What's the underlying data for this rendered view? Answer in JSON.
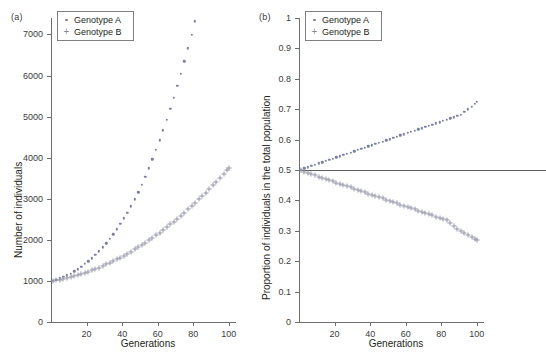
{
  "figure": {
    "panel_a_label": "(a)",
    "panel_b_label": "(b)"
  },
  "legend": {
    "series_a_label": "Genotype A",
    "series_b_label": "Genotype B",
    "marker_a": "dot",
    "marker_b": "plus"
  },
  "colors": {
    "series_a": "#7b7fa0",
    "series_b": "#9596a6",
    "axis": "#6e6e6e",
    "text": "#231f20",
    "reference_line": "#5d5d5d"
  },
  "chart_data": [
    {
      "type": "scatter",
      "panel": "(a)",
      "title": "",
      "xlabel": "Generations",
      "ylabel": "Number of individuals",
      "xlim": [
        0,
        104
      ],
      "ylim": [
        0,
        7400
      ],
      "xticks": [
        20,
        40,
        60,
        80,
        100
      ],
      "xticklabels": [
        "20",
        "40",
        "60",
        "80",
        "100"
      ],
      "yticks": [
        0,
        1000,
        2000,
        3000,
        4000,
        5000,
        6000,
        7000
      ],
      "yticklabels": [
        "0",
        "1000",
        "2000",
        "3000",
        "4000",
        "5000",
        "6000",
        "7000"
      ],
      "grid": false,
      "legend_position": "top-left",
      "x": [
        1,
        3,
        5,
        7,
        9,
        11,
        13,
        15,
        17,
        19,
        21,
        23,
        25,
        27,
        29,
        31,
        33,
        35,
        37,
        39,
        41,
        43,
        45,
        47,
        49,
        51,
        53,
        55,
        57,
        59,
        61,
        63,
        65,
        67,
        69,
        71,
        73,
        75,
        77,
        79,
        81,
        83,
        85,
        87,
        89,
        91,
        93,
        95,
        97,
        99,
        100
      ],
      "series": [
        {
          "name": "Genotype A",
          "marker": "dot",
          "values": [
            1005,
            1030,
            1060,
            1095,
            1135,
            1180,
            1230,
            1285,
            1345,
            1410,
            1480,
            1555,
            1635,
            1720,
            1815,
            1915,
            2020,
            2135,
            2255,
            2385,
            2520,
            2665,
            2820,
            2985,
            3160,
            3345,
            3540,
            3745,
            3960,
            4185,
            4420,
            4665,
            4920,
            5185,
            5460,
            5745,
            6040,
            6345,
            6660,
            6985,
            7320,
            7665,
            8020,
            8385,
            8760,
            9145,
            9540,
            9945,
            10360,
            10785,
            11000
          ]
        },
        {
          "name": "Genotype B",
          "marker": "plus",
          "values": [
            1000,
            1015,
            1032,
            1050,
            1070,
            1092,
            1115,
            1140,
            1167,
            1195,
            1225,
            1257,
            1290,
            1325,
            1362,
            1400,
            1440,
            1482,
            1525,
            1570,
            1617,
            1665,
            1715,
            1767,
            1820,
            1875,
            1932,
            1990,
            2050,
            2112,
            2175,
            2240,
            2307,
            2375,
            2445,
            2517,
            2590,
            2665,
            2742,
            2820,
            2900,
            2982,
            3065,
            3150,
            3237,
            3325,
            3415,
            3507,
            3600,
            3695,
            3745
          ]
        }
      ],
      "note": "Genotype A values above 7400 fall outside the displayed y-range; only points up to ~7050 at generation 100 are visible."
    },
    {
      "type": "scatter",
      "panel": "(b)",
      "title": "",
      "xlabel": "Generations",
      "ylabel": "Proportion of individuals in the total population",
      "xlim": [
        0,
        104
      ],
      "ylim": [
        0,
        1
      ],
      "xticks": [
        20,
        40,
        60,
        80,
        100
      ],
      "xticklabels": [
        "20",
        "40",
        "60",
        "80",
        "100"
      ],
      "yticks": [
        0,
        0.1,
        0.2,
        0.3,
        0.4,
        0.5,
        0.6,
        0.7,
        0.8,
        0.9,
        1
      ],
      "yticklabels": [
        "0",
        "0.1",
        "0.2",
        "0.3",
        "0.4",
        "0.5",
        "0.6",
        "0.7",
        "0.8",
        "0.9",
        "1"
      ],
      "grid": false,
      "legend_position": "top-left",
      "reference_line_y": 0.5,
      "x": [
        1,
        3,
        5,
        7,
        9,
        11,
        13,
        15,
        17,
        19,
        21,
        23,
        25,
        27,
        29,
        31,
        33,
        35,
        37,
        39,
        41,
        43,
        45,
        47,
        49,
        51,
        53,
        55,
        57,
        59,
        61,
        63,
        65,
        67,
        69,
        71,
        73,
        75,
        77,
        79,
        81,
        83,
        85,
        87,
        89,
        91,
        93,
        95,
        97,
        99,
        100
      ],
      "series": [
        {
          "name": "Genotype A",
          "marker": "dot",
          "values": [
            0.5015,
            0.5055,
            0.5095,
            0.5135,
            0.5175,
            0.5215,
            0.5255,
            0.5295,
            0.5335,
            0.5375,
            0.5415,
            0.5455,
            0.5495,
            0.5535,
            0.5575,
            0.5615,
            0.5655,
            0.5695,
            0.5735,
            0.5775,
            0.5815,
            0.5855,
            0.5895,
            0.5935,
            0.5975,
            0.6015,
            0.6055,
            0.6095,
            0.6135,
            0.6175,
            0.6215,
            0.6255,
            0.6295,
            0.6335,
            0.6375,
            0.6415,
            0.6455,
            0.6495,
            0.6535,
            0.6575,
            0.6615,
            0.6655,
            0.6695,
            0.6735,
            0.6775,
            0.6815,
            0.6905,
            0.6995,
            0.7085,
            0.7175,
            0.725
          ]
        },
        {
          "name": "Genotype B",
          "marker": "plus",
          "values": [
            0.4985,
            0.4945,
            0.4905,
            0.4865,
            0.4825,
            0.4785,
            0.4745,
            0.4705,
            0.4665,
            0.4625,
            0.4585,
            0.4545,
            0.4505,
            0.4465,
            0.4425,
            0.4385,
            0.4345,
            0.4305,
            0.4265,
            0.4225,
            0.4185,
            0.4145,
            0.4105,
            0.4065,
            0.4025,
            0.3985,
            0.3945,
            0.3905,
            0.3865,
            0.3825,
            0.3785,
            0.3745,
            0.3705,
            0.3665,
            0.3625,
            0.3585,
            0.3545,
            0.3505,
            0.3465,
            0.3425,
            0.3385,
            0.3345,
            0.3255,
            0.3165,
            0.3075,
            0.2985,
            0.2925,
            0.2865,
            0.2805,
            0.2745,
            0.27
          ]
        }
      ]
    }
  ]
}
